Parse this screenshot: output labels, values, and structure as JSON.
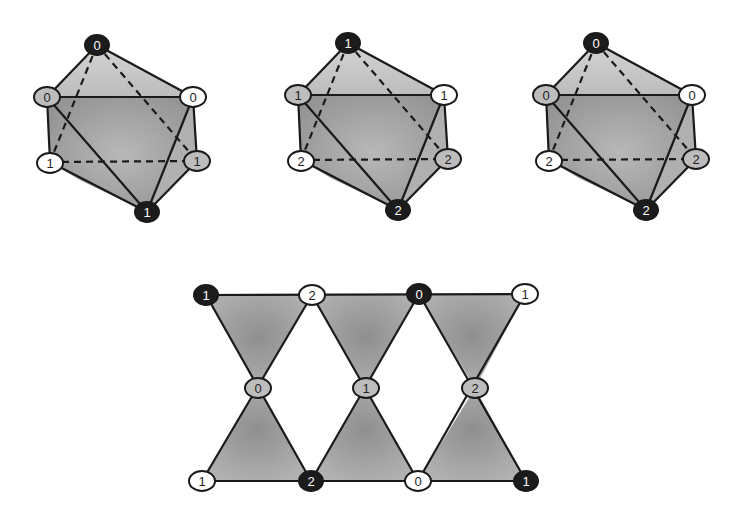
{
  "octahedra": [
    {
      "name": "octahedron-1",
      "offset_x": 0,
      "labels": {
        "top": "0",
        "upper_left": "0",
        "upper_right": "0",
        "lower_left": "1",
        "lower_right": "1",
        "bottom": "1"
      }
    },
    {
      "name": "octahedron-2",
      "offset_x": 251,
      "labels": {
        "top": "1",
        "upper_left": "1",
        "upper_right": "1",
        "lower_left": "2",
        "lower_right": "2",
        "bottom": "2"
      }
    },
    {
      "name": "octahedron-3",
      "offset_x": 499,
      "labels": {
        "top": "0",
        "upper_left": "0",
        "upper_right": "0",
        "lower_left": "2",
        "lower_right": "2",
        "bottom": "2"
      }
    }
  ],
  "strip": {
    "top_row": [
      "1",
      "2",
      "0",
      "1"
    ],
    "middle_row": [
      "0",
      "1",
      "2"
    ],
    "bottom_row": [
      "1",
      "2",
      "0",
      "1"
    ]
  },
  "node_styles": {
    "black": {
      "fill": "#1c1c1c",
      "text": "#ffffff"
    },
    "gray": {
      "fill": "#bdbdbd",
      "text": "#222222"
    },
    "white": {
      "fill": "#ffffff",
      "text": "#222222"
    }
  },
  "colors": {
    "face_light": "#c9c9c9",
    "face_mid": "#a8a8a8",
    "face_dark": "#8a8a8a",
    "edge": "#1a1a1a"
  }
}
